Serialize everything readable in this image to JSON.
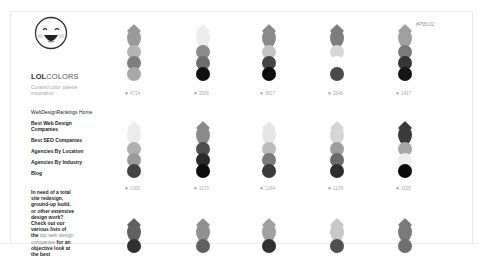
{
  "brand": {
    "bold": "LOL",
    "light": "COLORS",
    "tagline": "Curated color palette inspiration"
  },
  "nav": [
    {
      "label": "WebDesignRankings Home",
      "bold": false
    },
    {
      "label": "Best Web Design Companies",
      "bold": true
    },
    {
      "label": "Best SEO Companies",
      "bold": true
    },
    {
      "label": "Agencies By Location",
      "bold": true
    },
    {
      "label": "Agencies By Industry",
      "bold": true
    },
    {
      "label": "Blog",
      "bold": true
    }
  ],
  "promo": {
    "text1": "In need of a total site redesign, ground-up build, or other extensive design work? Check out our various lists of the",
    "link": "top web design companies",
    "text2": "for an objective look at the best"
  },
  "hover_hex": "#F5B102",
  "palettes": [
    {
      "row": 0,
      "col": 0,
      "colors": [
        "#9a9a9a",
        "#b4b4b4",
        "#7e7e7e",
        "#a8a8a8"
      ],
      "likes": "4714"
    },
    {
      "row": 0,
      "col": 1,
      "colors": [
        "#ececec",
        "#8c8c8c",
        "#6e6e6e",
        "#111111"
      ],
      "likes": "3306"
    },
    {
      "row": 0,
      "col": 2,
      "colors": [
        "#8a8a8a",
        "#c4c4c4",
        "#454545",
        "#0e0e0e"
      ],
      "likes": "3617"
    },
    {
      "row": 0,
      "col": 3,
      "colors": [
        "#7e7e7e",
        "#d6d6d6",
        "#ffffff",
        "#4a4a4a"
      ],
      "likes": "2646"
    },
    {
      "row": 0,
      "col": 4,
      "colors": [
        "#a0a0a0",
        "#7a7a7a",
        "#353535",
        "#151515"
      ],
      "likes": "1417"
    },
    {
      "row": 1,
      "col": 0,
      "colors": [
        "#ececec",
        "#b0b0b0",
        "#9a9a9a",
        "#444444"
      ],
      "likes": "1300"
    },
    {
      "row": 1,
      "col": 1,
      "colors": [
        "#8a8a8a",
        "#4e4e4e",
        "#2a2a2a",
        "#0c0c0c"
      ],
      "likes": "1070"
    },
    {
      "row": 1,
      "col": 2,
      "colors": [
        "#e6e6e6",
        "#bcbcbc",
        "#7a7a7a",
        "#3a3a3a"
      ],
      "likes": "1264"
    },
    {
      "row": 1,
      "col": 3,
      "colors": [
        "#d6d6d6",
        "#9e9e9e",
        "#6a6a6a",
        "#2e2e2e"
      ],
      "likes": "1278"
    },
    {
      "row": 1,
      "col": 4,
      "colors": [
        "#3a3a3a",
        "#a6a6a6",
        "#eeeeee",
        "#0a0a0a"
      ],
      "likes": "1635"
    },
    {
      "row": 2,
      "col": 0,
      "colors": [
        "#606060",
        "#303030"
      ],
      "likes": ""
    },
    {
      "row": 2,
      "col": 1,
      "colors": [
        "#909090",
        "#606060"
      ],
      "likes": ""
    },
    {
      "row": 2,
      "col": 2,
      "colors": [
        "#a0a0a0",
        "#303030"
      ],
      "likes": ""
    },
    {
      "row": 2,
      "col": 3,
      "colors": [
        "#c8c8c8",
        "#505050"
      ],
      "likes": ""
    },
    {
      "row": 2,
      "col": 4,
      "colors": [
        "#7a7a7a",
        "#707070"
      ],
      "likes": ""
    }
  ]
}
